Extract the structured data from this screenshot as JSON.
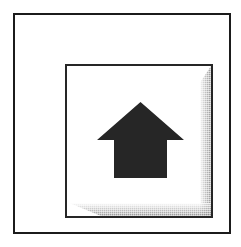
{
  "screenshot": {
    "width": 241,
    "height": 247,
    "background_color": "#ffffff"
  },
  "outer_frame": {
    "label": "Outer border frame",
    "border_color": "#1b1b1b",
    "fill_color": "#ffffff"
  },
  "button": {
    "label": "Home",
    "tooltip": "Home",
    "border_color": "#262626",
    "face_color": "#ffffff",
    "shadow_color": "#808080",
    "state": "raised",
    "icon": {
      "name": "home-icon",
      "glyph": "house",
      "color": "#262626",
      "description": "Solid black house with triangular roof and square body"
    }
  }
}
